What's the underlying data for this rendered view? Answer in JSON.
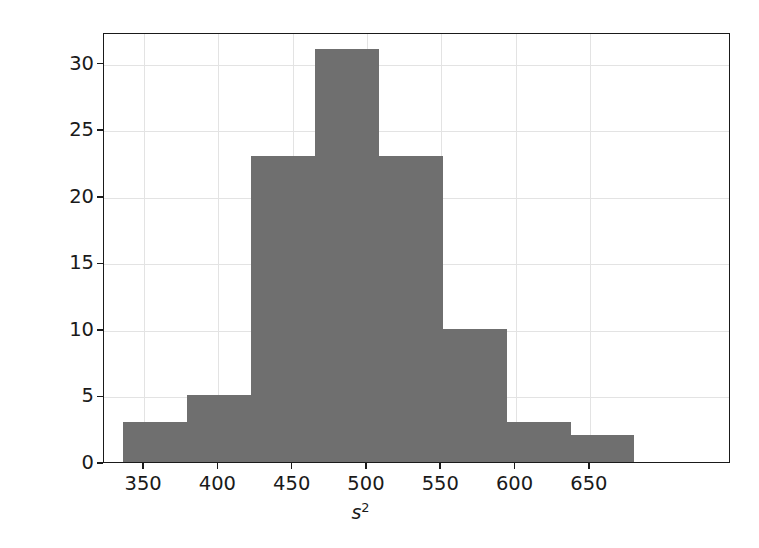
{
  "figure": {
    "background_color": "#ffffff",
    "axes_color": "#1a1a1a",
    "grid_color": "#e3e3e3",
    "bar_color": "#6f6f6f"
  },
  "axis": {
    "xlabel_base": "s",
    "xlabel_sup": "2",
    "ylabel": "",
    "xticks": [
      "350",
      "400",
      "450",
      "500",
      "550",
      "600",
      "650"
    ],
    "yticks": [
      "0",
      "5",
      "10",
      "15",
      "20",
      "25",
      "30"
    ]
  },
  "chart_data": {
    "type": "bar",
    "title": "",
    "xlabel": "s^2",
    "ylabel": "",
    "grid": true,
    "legend": "none",
    "xlim": [
      323,
      745
    ],
    "ylim": [
      0,
      32.3
    ],
    "xticks": [
      350,
      400,
      450,
      500,
      550,
      600,
      650
    ],
    "yticks": [
      0,
      5,
      10,
      15,
      20,
      25,
      30
    ],
    "bin_edges": [
      336,
      379,
      422,
      465,
      508,
      551,
      594,
      637,
      680
    ],
    "categories": [
      "336-379",
      "379-422",
      "422-465",
      "465-508",
      "508-551",
      "551-594",
      "594-637",
      "637-680"
    ],
    "values": [
      3,
      5,
      23,
      31,
      23,
      10,
      3,
      2
    ],
    "bars": [
      {
        "left": 336,
        "right": 379,
        "value": 3
      },
      {
        "left": 379,
        "right": 422,
        "value": 5
      },
      {
        "left": 422,
        "right": 465,
        "value": 23
      },
      {
        "left": 465,
        "right": 508,
        "value": 31
      },
      {
        "left": 508,
        "right": 551,
        "value": 23
      },
      {
        "left": 551,
        "right": 594,
        "value": 10
      },
      {
        "left": 594,
        "right": 637,
        "value": 3
      },
      {
        "left": 637,
        "right": 680,
        "value": 2
      }
    ]
  }
}
